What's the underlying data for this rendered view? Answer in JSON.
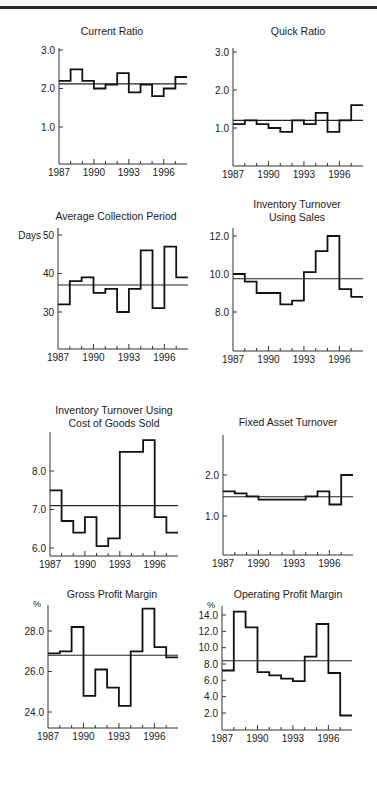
{
  "page": {
    "header_text_cut": ""
  },
  "chart_data": [
    {
      "id": "current-ratio",
      "type": "line",
      "step": true,
      "title": [
        "Current Ratio"
      ],
      "ylabel": "",
      "x": [
        1987,
        1988,
        1989,
        1990,
        1991,
        1992,
        1993,
        1994,
        1995,
        1996,
        1997
      ],
      "xticks": [
        "1987",
        "1990",
        "1993",
        "1996"
      ],
      "yticks": [
        1.0,
        2.0,
        3.0
      ],
      "ytick_labels": [
        "1.0",
        "2.0",
        "3.0"
      ],
      "ylim": [
        0.0,
        3.2
      ],
      "values": [
        2.2,
        2.5,
        2.2,
        2.0,
        2.1,
        2.4,
        1.9,
        2.1,
        1.8,
        2.0,
        2.3
      ],
      "average": 2.12,
      "geom": {
        "x0": 59,
        "x1": 187,
        "y_axis_top": 48,
        "y_axis_bottom": 164,
        "ya": 3.0,
        "ya_px": 50,
        "yb": 1.0,
        "yb_px": 127,
        "title_x": 112,
        "title_y": 35
      }
    },
    {
      "id": "quick-ratio",
      "type": "line",
      "step": true,
      "title": [
        "Quick Ratio"
      ],
      "ylabel": "",
      "x": [
        1987,
        1988,
        1989,
        1990,
        1991,
        1992,
        1993,
        1994,
        1995,
        1996,
        1997
      ],
      "xticks": [
        "1987",
        "1990",
        "1993",
        "1996"
      ],
      "yticks": [
        1.0,
        2.0,
        3.0
      ],
      "ytick_labels": [
        "1.0",
        "2.0",
        "3.0"
      ],
      "ylim": [
        0.0,
        3.2
      ],
      "values": [
        1.1,
        1.2,
        1.1,
        1.0,
        0.9,
        1.2,
        1.1,
        1.4,
        0.9,
        1.2,
        1.6
      ],
      "average": 1.2,
      "geom": {
        "x0": 233,
        "x1": 363,
        "y_axis_top": 48,
        "y_axis_bottom": 166,
        "ya": 3.0,
        "ya_px": 52,
        "yb": 1.0,
        "yb_px": 128,
        "title_x": 298,
        "title_y": 35
      }
    },
    {
      "id": "average-collection-period",
      "type": "line",
      "step": true,
      "title": [
        "Average Collection Period"
      ],
      "ylabel": "Days",
      "x": [
        1987,
        1988,
        1989,
        1990,
        1991,
        1992,
        1993,
        1994,
        1995,
        1996,
        1997
      ],
      "xticks": [
        "1987",
        "1990",
        "1993",
        "1996"
      ],
      "yticks": [
        30,
        40,
        50
      ],
      "ytick_labels": [
        "30",
        "40",
        "50"
      ],
      "ylim": [
        20,
        52
      ],
      "values": [
        32,
        38,
        39,
        35,
        36,
        30,
        36,
        46,
        31,
        47,
        39
      ],
      "average": 37,
      "geom": {
        "x0": 58,
        "x1": 188,
        "y_axis_top": 228,
        "y_axis_bottom": 349,
        "ya": 50,
        "ya_px": 235,
        "yb": 30,
        "yb_px": 312,
        "title_x": 116,
        "title_y": 220
      }
    },
    {
      "id": "inventory-turnover-sales",
      "type": "line",
      "step": true,
      "title": [
        "Inventory Turnover",
        "Using Sales"
      ],
      "ylabel": "",
      "x": [
        1987,
        1988,
        1989,
        1990,
        1991,
        1992,
        1993,
        1994,
        1995,
        1996,
        1997
      ],
      "xticks": [
        "1987",
        "1990",
        "1993",
        "1996"
      ],
      "yticks": [
        8.0,
        10.0,
        12.0
      ],
      "ytick_labels": [
        "8.0",
        "10.0",
        "12.0"
      ],
      "ylim": [
        6.0,
        12.5
      ],
      "values": [
        10.0,
        9.6,
        9.0,
        9.0,
        8.4,
        8.6,
        10.1,
        11.2,
        12.0,
        9.2,
        8.8
      ],
      "average": 9.75,
      "geom": {
        "x0": 233,
        "x1": 363,
        "y_axis_top": 228,
        "y_axis_bottom": 351,
        "ya": 12.0,
        "ya_px": 236,
        "yb": 8.0,
        "yb_px": 312,
        "title_x": 297,
        "title_y": 208
      }
    },
    {
      "id": "inventory-turnover-cogs",
      "type": "line",
      "step": true,
      "title": [
        "Inventory Turnover Using",
        "Cost of Goods Sold"
      ],
      "ylabel": "",
      "x": [
        1987,
        1988,
        1989,
        1990,
        1991,
        1992,
        1993,
        1994,
        1995,
        1996,
        1997
      ],
      "xticks": [
        "1987",
        "1990",
        "1993",
        "1996"
      ],
      "yticks": [
        6.0,
        7.0,
        8.0
      ],
      "ytick_labels": [
        "6.0",
        "7.0",
        "8.0"
      ],
      "ylim": [
        5.8,
        9.0
      ],
      "values": [
        7.5,
        6.7,
        6.4,
        6.8,
        6.05,
        6.25,
        8.5,
        8.5,
        8.8,
        6.8,
        6.4
      ],
      "average": 7.1,
      "geom": {
        "x0": 50,
        "x1": 178,
        "y_axis_top": 432,
        "y_axis_bottom": 556,
        "ya": 8.0,
        "ya_px": 471,
        "yb": 6.0,
        "yb_px": 548,
        "title_x": 114,
        "title_y": 414
      }
    },
    {
      "id": "fixed-asset-turnover",
      "type": "line",
      "step": true,
      "title": [
        "Fixed Asset Turnover"
      ],
      "ylabel": "",
      "x": [
        1987,
        1988,
        1989,
        1990,
        1991,
        1992,
        1993,
        1994,
        1995,
        1996,
        1997
      ],
      "xticks": [
        "1987",
        "1990",
        "1993",
        "1996"
      ],
      "yticks": [
        1.0,
        2.0
      ],
      "ytick_labels": [
        "1.0",
        "2.0"
      ],
      "ylim": [
        0.0,
        2.6
      ],
      "values": [
        1.6,
        1.55,
        1.48,
        1.4,
        1.4,
        1.4,
        1.4,
        1.48,
        1.6,
        1.28,
        2.0
      ],
      "average": 1.47,
      "geom": {
        "x0": 223,
        "x1": 353,
        "y_axis_top": 435,
        "y_axis_bottom": 555,
        "ya": 2.0,
        "ya_px": 475,
        "yb": 1.0,
        "yb_px": 516,
        "title_x": 288,
        "title_y": 426
      }
    },
    {
      "id": "gross-profit-margin",
      "type": "line",
      "step": true,
      "title": [
        "Gross Profit Margin"
      ],
      "ylabel": "%",
      "x": [
        1987,
        1988,
        1989,
        1990,
        1991,
        1992,
        1993,
        1994,
        1995,
        1996,
        1997
      ],
      "xticks": [
        "1987",
        "1990",
        "1993",
        "1996"
      ],
      "yticks": [
        24.0,
        26.0,
        28.0
      ],
      "ytick_labels": [
        "24.0",
        "26.0",
        "28.0"
      ],
      "ylim": [
        23.2,
        29.5
      ],
      "values": [
        26.9,
        27.0,
        28.2,
        24.8,
        26.1,
        25.2,
        24.3,
        27.0,
        29.1,
        27.2,
        26.7
      ],
      "average": 26.8,
      "geom": {
        "x0": 48,
        "x1": 178,
        "y_axis_top": 605,
        "y_axis_bottom": 728,
        "ya": 28.0,
        "ya_px": 631,
        "yb": 24.0,
        "yb_px": 712,
        "title_x": 112,
        "title_y": 598
      }
    },
    {
      "id": "operating-profit-margin",
      "type": "line",
      "step": true,
      "title": [
        "Operating Profit Margin"
      ],
      "ylabel": "%",
      "x": [
        1987,
        1988,
        1989,
        1990,
        1991,
        1992,
        1993,
        1994,
        1995,
        1996,
        1997
      ],
      "xticks": [
        "1987",
        "1990",
        "1993",
        "1996"
      ],
      "yticks": [
        2.0,
        4.0,
        6.0,
        8.0,
        10.0,
        12.0,
        14.0
      ],
      "ytick_labels": [
        "2.0",
        "4.0",
        "6.0",
        "8.0",
        "10.0",
        "12.0",
        "14.0"
      ],
      "ylim": [
        0.0,
        15.0
      ],
      "values": [
        7.2,
        14.4,
        12.5,
        7.0,
        6.6,
        6.2,
        5.9,
        8.9,
        12.9,
        6.9,
        1.7
      ],
      "average": 8.4,
      "geom": {
        "x0": 222,
        "x1": 352,
        "y_axis_top": 606,
        "y_axis_bottom": 730,
        "ya": 14.0,
        "ya_px": 615,
        "yb": 2.0,
        "yb_px": 713,
        "title_x": 288,
        "title_y": 598
      }
    }
  ]
}
